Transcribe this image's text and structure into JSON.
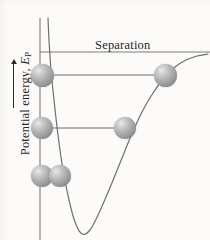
{
  "figure": {
    "title_hidden": "Interatomic potential energy versus separation",
    "background_color": "#fcfbf9"
  },
  "axes": {
    "y_label_text": "Potential energy, ",
    "y_label_symbol": "E",
    "y_label_subscript": "P",
    "y_arrow": "up-arrow",
    "x_label": "Separation"
  },
  "colors": {
    "curve": "#6f6f6f",
    "axis": "#7a7a7a",
    "level_line": "#6f6f6f",
    "sphere_light": "#e9e9e9",
    "sphere_dark": "#6e6e6e",
    "text": "#262626"
  },
  "chart_data": {
    "type": "line",
    "title": "",
    "xlabel": "Separation",
    "ylabel": "Potential energy, E_P",
    "grid": false,
    "legend": "none",
    "xlim": [
      0,
      210
    ],
    "ylim": [
      240,
      0
    ],
    "asymptote_y": 52,
    "curve_points": [
      [
        48,
        18
      ],
      [
        49,
        40
      ],
      [
        51,
        70
      ],
      [
        54,
        100
      ],
      [
        58,
        135
      ],
      [
        63,
        170
      ],
      [
        69,
        200
      ],
      [
        75,
        222
      ],
      [
        82,
        234
      ],
      [
        90,
        230
      ],
      [
        99,
        213
      ],
      [
        109,
        190
      ],
      [
        120,
        163
      ],
      [
        131,
        136
      ],
      [
        142,
        112
      ],
      [
        153,
        93
      ],
      [
        164,
        78
      ],
      [
        175,
        67
      ],
      [
        186,
        60
      ],
      [
        197,
        56
      ],
      [
        208,
        54
      ]
    ],
    "energy_levels": [
      {
        "name": "upper-level",
        "y": 75,
        "x_start": 42,
        "x_end": 165,
        "spheres": [
          {
            "cx": 42,
            "cy": 75,
            "r": 11.5
          },
          {
            "cx": 165,
            "cy": 75,
            "r": 11.5
          }
        ]
      },
      {
        "name": "middle-level",
        "y": 128,
        "x_start": 42,
        "x_end": 125,
        "spheres": [
          {
            "cx": 42,
            "cy": 128,
            "r": 11
          },
          {
            "cx": 125,
            "cy": 128,
            "r": 11
          }
        ]
      },
      {
        "name": "lower-level",
        "y": 176,
        "x_start": 42,
        "x_end": 60,
        "spheres": [
          {
            "cx": 42,
            "cy": 176,
            "r": 11
          },
          {
            "cx": 60,
            "cy": 176,
            "r": 11
          }
        ]
      }
    ],
    "y_axis_line": {
      "x": 40,
      "y_top": 18,
      "y_bottom": 240
    },
    "x_axis_line": {
      "y": 52,
      "x_start": 40,
      "x_end": 210
    }
  }
}
